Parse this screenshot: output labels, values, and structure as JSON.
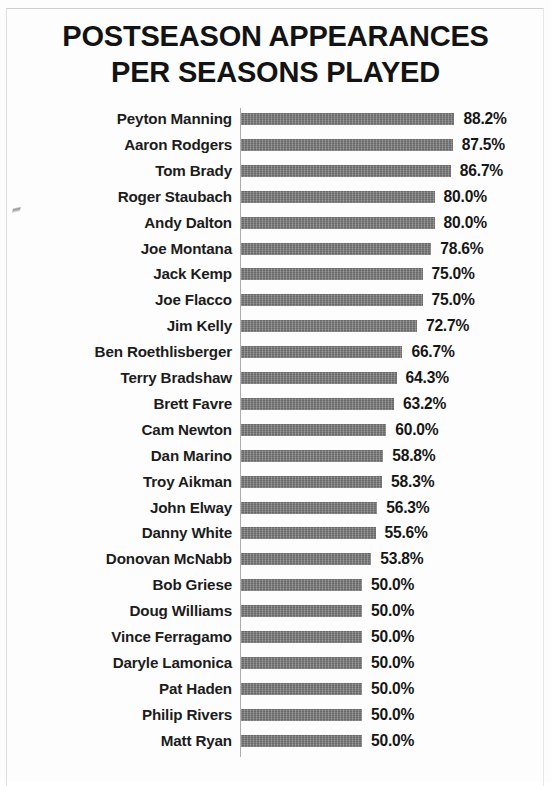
{
  "page": {
    "title_lines": [
      "POSTSEASON APPEARANCES",
      "PER SEASONS PLAYED"
    ],
    "bar_color": "#767676",
    "axis_color": "#adadad",
    "text_color": "#1c1c1c"
  },
  "chart_data": {
    "type": "bar",
    "orientation": "horizontal",
    "title": "POSTSEASON APPEARANCES PER SEASONS PLAYED",
    "xlabel": "",
    "ylabel": "",
    "grid": false,
    "legend": "none",
    "xlim": [
      0,
      100
    ],
    "units": "%",
    "axis_ticks_visible": false,
    "categories": [
      "Peyton Manning",
      "Aaron Rodgers",
      "Tom Brady",
      "Roger Staubach",
      "Andy Dalton",
      "Joe Montana",
      "Jack Kemp",
      "Joe Flacco",
      "Jim Kelly",
      "Ben Roethlisberger",
      "Terry Bradshaw",
      "Brett Favre",
      "Cam Newton",
      "Dan Marino",
      "Troy Aikman",
      "John Elway",
      "Danny White",
      "Donovan McNabb",
      "Bob Griese",
      "Doug Williams",
      "Vince Ferragamo",
      "Daryle Lamonica",
      "Pat Haden",
      "Philip Rivers",
      "Matt Ryan"
    ],
    "values": [
      88.2,
      87.5,
      86.7,
      80.0,
      80.0,
      78.6,
      75.0,
      75.0,
      72.7,
      66.7,
      64.3,
      63.2,
      60.0,
      58.8,
      58.3,
      56.3,
      55.6,
      53.8,
      50.0,
      50.0,
      50.0,
      50.0,
      50.0,
      50.0,
      50.0
    ],
    "data_labels": [
      "88.2%",
      "87.5%",
      "86.7%",
      "80.0%",
      "80.0%",
      "78.6%",
      "75.0%",
      "75.0%",
      "72.7%",
      "66.7%",
      "64.3%",
      "63.2%",
      "60.0%",
      "58.8%",
      "58.3%",
      "56.3%",
      "55.6%",
      "53.8%",
      "50.0%",
      "50.0%",
      "50.0%",
      "50.0%",
      "50.0%",
      "50.0%",
      "50.0%"
    ]
  }
}
